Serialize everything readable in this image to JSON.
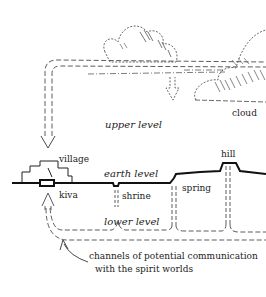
{
  "diagram": {
    "labels": {
      "cloud": "cloud",
      "upper_level": "upper level",
      "village": "village",
      "earth_level": "earth level",
      "kiva": "kiva",
      "shrine": "shrine",
      "spring": "spring",
      "hill": "hill",
      "lower_level": "lower level",
      "caption_line1": "channels of potential communication",
      "caption_line2": "with the spirit worlds"
    },
    "colors": {
      "ink": "#222222",
      "background": "#ffffff"
    }
  }
}
